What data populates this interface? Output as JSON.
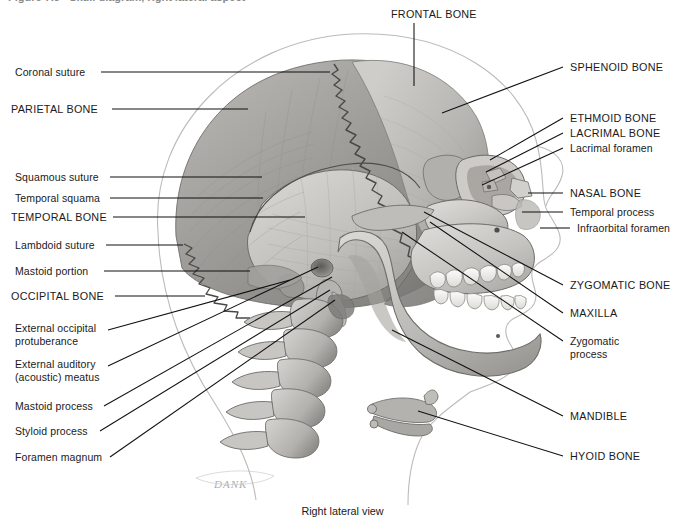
{
  "figure": {
    "caption": "Right lateral view",
    "artist_signature": "DANK",
    "cut_off_header": "Figure 7.3   Skull diagram, right lateral aspect",
    "colors": {
      "ink": "#1a1a1a",
      "leader_line": "#111111",
      "bone_light": "#d8d6d2",
      "bone_mid": "#a8a6a2",
      "bone_dark": "#7d7b78",
      "outline_faint": "#b9b7b4",
      "background": "#ffffff"
    }
  },
  "labels_top": [
    {
      "text": "FRONTAL BONE",
      "style": "caps",
      "x": 391,
      "y": 8
    }
  ],
  "labels_left": [
    {
      "text": "Coronal suture",
      "style": "normal",
      "x": 15,
      "y": 66
    },
    {
      "text": "PARIETAL BONE",
      "style": "caps",
      "x": 11,
      "y": 103
    },
    {
      "text": "Squamous suture",
      "style": "normal",
      "x": 15,
      "y": 171
    },
    {
      "text": "Temporal squama",
      "style": "normal",
      "x": 15,
      "y": 192
    },
    {
      "text": "TEMPORAL BONE",
      "style": "caps",
      "x": 11,
      "y": 211
    },
    {
      "text": "Lambdoid suture",
      "style": "normal",
      "x": 15,
      "y": 239
    },
    {
      "text": "Mastoid portion",
      "style": "normal",
      "x": 15,
      "y": 265
    },
    {
      "text": "OCCIPITAL BONE",
      "style": "caps",
      "x": 11,
      "y": 290
    },
    {
      "text": "External occipital\nprotuberance",
      "style": "normal",
      "x": 15,
      "y": 322
    },
    {
      "text": "External auditory\n(acoustic) meatus",
      "style": "normal",
      "x": 15,
      "y": 358
    },
    {
      "text": "Mastoid process",
      "style": "normal",
      "x": 15,
      "y": 400
    },
    {
      "text": "Styloid process",
      "style": "normal",
      "x": 15,
      "y": 425
    },
    {
      "text": "Foramen magnum",
      "style": "normal",
      "x": 15,
      "y": 451
    }
  ],
  "labels_right": [
    {
      "text": "SPHENOID BONE",
      "style": "caps",
      "x": 570,
      "y": 61
    },
    {
      "text": "ETHMOID BONE",
      "style": "caps",
      "x": 570,
      "y": 112
    },
    {
      "text": "LACRIMAL BONE",
      "style": "caps",
      "x": 570,
      "y": 127
    },
    {
      "text": "Lacrimal foramen",
      "style": "normal",
      "x": 570,
      "y": 142
    },
    {
      "text": "NASAL BONE",
      "style": "caps",
      "x": 570,
      "y": 187
    },
    {
      "text": "Temporal process",
      "style": "normal",
      "x": 570,
      "y": 206
    },
    {
      "text": "Infraorbital foramen",
      "style": "normal",
      "x": 577,
      "y": 222
    },
    {
      "text": "ZYGOMATIC BONE",
      "style": "caps",
      "x": 570,
      "y": 279
    },
    {
      "text": "MAXILLA",
      "style": "caps",
      "x": 570,
      "y": 307
    },
    {
      "text": "Zygomatic\nprocess",
      "style": "normal",
      "x": 570,
      "y": 335
    },
    {
      "text": "MANDIBLE",
      "style": "caps",
      "x": 570,
      "y": 410
    },
    {
      "text": "HYOID BONE",
      "style": "caps",
      "x": 570,
      "y": 450
    }
  ],
  "leader_lines": [
    {
      "name": "frontal-bone",
      "x1": 414,
      "y1": 23,
      "x2": 414,
      "y2": 86
    },
    {
      "name": "coronal-suture",
      "x1": 101,
      "y1": 72,
      "x2": 330,
      "y2": 72
    },
    {
      "name": "parietal-bone",
      "x1": 112,
      "y1": 109,
      "x2": 248,
      "y2": 109
    },
    {
      "name": "squamous-suture",
      "x1": 110,
      "y1": 177,
      "x2": 262,
      "y2": 177
    },
    {
      "name": "temporal-squama",
      "x1": 110,
      "y1": 198,
      "x2": 263,
      "y2": 198
    },
    {
      "name": "temporal-bone",
      "x1": 113,
      "y1": 217,
      "x2": 305,
      "y2": 217
    },
    {
      "name": "lambdoid-suture",
      "x1": 106,
      "y1": 245,
      "x2": 183,
      "y2": 245
    },
    {
      "name": "mastoid-portion",
      "x1": 104,
      "y1": 271,
      "x2": 250,
      "y2": 271
    },
    {
      "name": "occipital-bone",
      "x1": 115,
      "y1": 296,
      "x2": 205,
      "y2": 296
    },
    {
      "name": "external-occipital-protuberance",
      "x1": 108,
      "y1": 330,
      "x2": 290,
      "y2": 280
    },
    {
      "name": "external-auditory-meatus",
      "x1": 108,
      "y1": 366,
      "x2": 318,
      "y2": 267
    },
    {
      "name": "mastoid-process",
      "x1": 104,
      "y1": 406,
      "x2": 332,
      "y2": 277
    },
    {
      "name": "styloid-process",
      "x1": 100,
      "y1": 431,
      "x2": 330,
      "y2": 290
    },
    {
      "name": "foramen-magnum",
      "x1": 110,
      "y1": 457,
      "x2": 335,
      "y2": 300
    },
    {
      "name": "sphenoid-bone",
      "x1": 563,
      "y1": 67,
      "x2": 442,
      "y2": 113
    },
    {
      "name": "ethmoid-bone",
      "x1": 563,
      "y1": 118,
      "x2": 490,
      "y2": 160
    },
    {
      "name": "lacrimal-bone",
      "x1": 563,
      "y1": 133,
      "x2": 486,
      "y2": 172
    },
    {
      "name": "lacrimal-foramen",
      "x1": 563,
      "y1": 148,
      "x2": 482,
      "y2": 185
    },
    {
      "name": "nasal-bone",
      "x1": 563,
      "y1": 193,
      "x2": 528,
      "y2": 193
    },
    {
      "name": "temporal-process",
      "x1": 563,
      "y1": 212,
      "x2": 522,
      "y2": 212
    },
    {
      "name": "infraorbital-foramen",
      "x1": 570,
      "y1": 228,
      "x2": 540,
      "y2": 228
    },
    {
      "name": "zygomatic-bone",
      "x1": 563,
      "y1": 285,
      "x2": 424,
      "y2": 212
    },
    {
      "name": "maxilla",
      "x1": 563,
      "y1": 313,
      "x2": 430,
      "y2": 222
    },
    {
      "name": "zygomatic-process",
      "x1": 563,
      "y1": 341,
      "x2": 402,
      "y2": 232
    },
    {
      "name": "mandible",
      "x1": 563,
      "y1": 416,
      "x2": 392,
      "y2": 330
    },
    {
      "name": "hyoid-bone",
      "x1": 563,
      "y1": 456,
      "x2": 418,
      "y2": 411
    }
  ]
}
